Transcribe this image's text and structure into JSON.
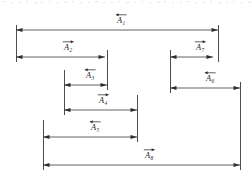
{
  "figure": {
    "name": "dimension-chain-diagram",
    "type": "engineering-dimension-chain",
    "width": 252,
    "height": 181,
    "background_color": "#ffffff",
    "line_color": "#3a3a3a",
    "text_color": "#1f1f1f"
  },
  "notation": {
    "symbol": "A",
    "style": "italic-with-overhead-arrow",
    "description": "Each dimension is labelled with an italic capital A carrying a subscript index and an overhead vector arrow."
  },
  "dimensions": [
    {
      "id": "A1",
      "label": "A",
      "subscript": "1",
      "x_start": 16,
      "x_end": 218,
      "y": 30,
      "label_x": 117,
      "label_y": 23,
      "vector_direction": "left",
      "arrow_left": true,
      "arrow_right": true
    },
    {
      "id": "A2",
      "label": "A",
      "subscript": "2",
      "x_start": 16,
      "x_end": 105,
      "y": 57,
      "label_x": 64,
      "label_y": 50,
      "vector_direction": "right",
      "arrow_left": true,
      "arrow_right": true
    },
    {
      "id": "A7",
      "label": "A",
      "subscript": "7",
      "x_start": 170,
      "x_end": 213,
      "y": 57,
      "label_x": 196,
      "label_y": 50,
      "vector_direction": "right",
      "arrow_left": true,
      "arrow_right": true
    },
    {
      "id": "A3",
      "label": "A",
      "subscript": "3",
      "x_start": 64,
      "x_end": 107,
      "y": 85,
      "label_x": 86,
      "label_y": 78,
      "vector_direction": "left",
      "arrow_left": true,
      "arrow_right": true
    },
    {
      "id": "A6",
      "label": "A",
      "subscript": "6",
      "x_start": 170,
      "x_end": 240,
      "y": 88,
      "label_x": 206,
      "label_y": 81,
      "vector_direction": "left",
      "arrow_left": true,
      "arrow_right": true
    },
    {
      "id": "A4",
      "label": "A",
      "subscript": "4",
      "x_start": 64,
      "x_end": 137,
      "y": 110,
      "label_x": 99,
      "label_y": 103,
      "vector_direction": "right",
      "arrow_left": true,
      "arrow_right": true
    },
    {
      "id": "A5",
      "label": "A",
      "subscript": "5",
      "x_start": 43,
      "x_end": 137,
      "y": 137,
      "label_x": 91,
      "label_y": 130,
      "vector_direction": "left",
      "arrow_left": true,
      "arrow_right": true
    },
    {
      "id": "A8",
      "label": "A",
      "subscript": "8",
      "x_start": 43,
      "x_end": 240,
      "y": 165,
      "label_x": 145,
      "label_y": 158,
      "vector_direction": "right",
      "arrow_left": true,
      "arrow_right": true
    }
  ],
  "extension_lines": [
    {
      "id": "ext-left-outer",
      "x": 16,
      "y_top": 25,
      "y_bottom": 62
    },
    {
      "id": "ext-a5-left",
      "x": 43,
      "y_top": 120,
      "y_bottom": 170
    },
    {
      "id": "ext-a3-left",
      "x": 64,
      "y_top": 70,
      "y_bottom": 115
    },
    {
      "id": "ext-a2-right",
      "x": 107,
      "y_top": 50,
      "y_bottom": 90
    },
    {
      "id": "ext-a4-right",
      "x": 137,
      "y_top": 95,
      "y_bottom": 142
    },
    {
      "id": "ext-a7-left",
      "x": 170,
      "y_top": 50,
      "y_bottom": 93
    },
    {
      "id": "ext-a1-right",
      "x": 218,
      "y_top": 25,
      "y_bottom": 62
    },
    {
      "id": "ext-right-outer",
      "x": 240,
      "y_top": 82,
      "y_bottom": 170
    }
  ]
}
